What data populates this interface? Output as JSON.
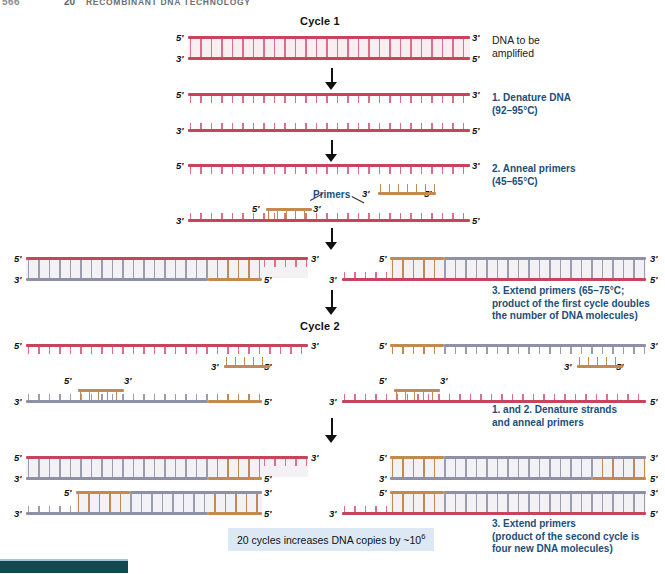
{
  "running_head": {
    "page_number": "566",
    "chapter_number": "20",
    "chapter_title": "RECOMBINANT DNA TECHNOLOGY"
  },
  "figure": {
    "cycle1_title": "Cycle 1",
    "cycle2_title": "Cycle 2",
    "primers_label": "Primers"
  },
  "captions": {
    "dna_to_be_amplified": "DNA to be\namplified",
    "step1_denature": "1. Denature DNA\n(92–95°C)",
    "step2_anneal": "2. Anneal primers\n(45–65°C)",
    "step3_extend": "3. Extend primers (65–75°C;\nproduct of the first cycle doubles\nthe number of DNA molecules)",
    "cycle2_step12": "1. and 2. Denature strands\nand anneal primers",
    "cycle2_step3": "3. Extend primers\n(product of the second cycle is\nfour new DNA molecules)"
  },
  "note": {
    "text_before": "20 cycles increases DNA copies by ~10",
    "exponent": "6"
  },
  "end_labels": {
    "five_prime": "5'",
    "three_prime": "3'"
  },
  "colors": {
    "template_strand": "#c8445c",
    "new_strand": "#8e90a6",
    "primer": "#c08a52",
    "caption_blue": "#1a4f7a",
    "note_background": "#dce9f4",
    "bottom_bar": "#14474f"
  },
  "chart_data": {
    "type": "diagram",
    "stages": [
      {
        "cycle": "Cycle 1",
        "step": "start",
        "label": "DNA to be amplified",
        "molecules": [
          {
            "top_strand": "template",
            "bottom_strand": "template"
          }
        ]
      },
      {
        "cycle": "Cycle 1",
        "step": "1. Denature DNA (92–95°C)",
        "molecules": [
          {
            "strand": "template",
            "single": true
          },
          {
            "strand": "template",
            "single": true
          }
        ]
      },
      {
        "cycle": "Cycle 1",
        "step": "2. Anneal primers (45–65°C)",
        "molecules": [
          {
            "strand": "template",
            "primers": 1
          },
          {
            "strand": "template",
            "primers": 1
          }
        ]
      },
      {
        "cycle": "Cycle 1",
        "step": "3. Extend primers (65–75°C; product of the first cycle doubles the number of DNA molecules)",
        "molecules": [
          {
            "top_strand": "template",
            "bottom_strand": "new"
          },
          {
            "top_strand": "new",
            "bottom_strand": "template"
          }
        ]
      },
      {
        "cycle": "Cycle 2",
        "step": "1. and 2. Denature strands and anneal primers",
        "molecules": 4
      },
      {
        "cycle": "Cycle 2",
        "step": "3. Extend primers (product of the second cycle is four new DNA molecules)",
        "molecules": 4
      }
    ]
  }
}
